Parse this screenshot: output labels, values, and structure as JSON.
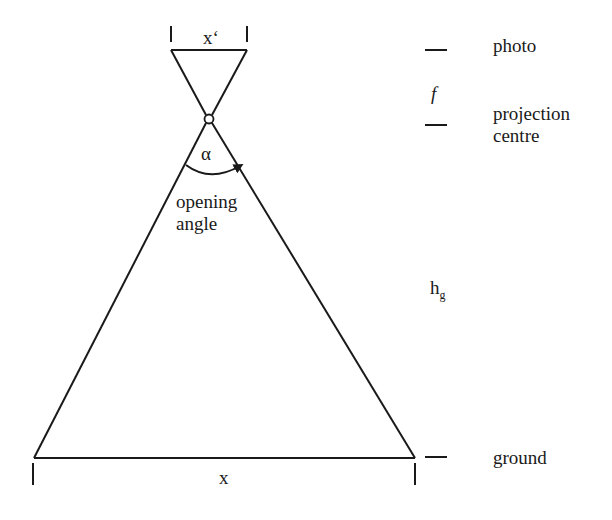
{
  "diagram": {
    "type": "aerial photo projection geometry",
    "labels": {
      "photo_width": "x‘",
      "focal_length": "f",
      "angle_symbol": "α",
      "opening_angle_line1": "opening",
      "opening_angle_line2": "angle",
      "flying_height": "h",
      "flying_height_sub": "g",
      "ground_width": "x"
    },
    "legend": {
      "photo": "photo",
      "projection_line1": "projection",
      "projection_line2": "centre",
      "ground": "ground"
    },
    "colors": {
      "line": "#1a1a1a",
      "background": "#ffffff"
    }
  }
}
